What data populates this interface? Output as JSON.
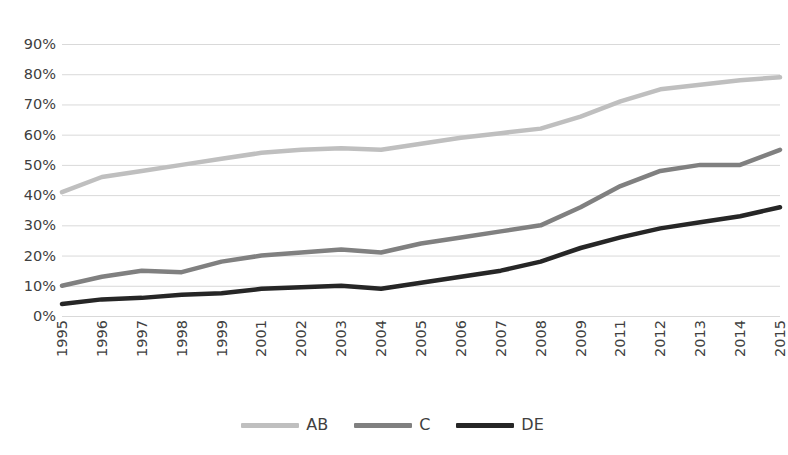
{
  "chart_data": {
    "type": "line",
    "title": "",
    "xlabel": "",
    "ylabel": "",
    "ylim": [
      0,
      90
    ],
    "grid": true,
    "legend_position": "bottom",
    "categories": [
      "1995",
      "1996",
      "1997",
      "1998",
      "1999",
      "2001",
      "2002",
      "2003",
      "2004",
      "2005",
      "2006",
      "2007",
      "2008",
      "2009",
      "2011",
      "2012",
      "2013",
      "2014",
      "2015"
    ],
    "y_tick_labels": [
      "90%",
      "80%",
      "70%",
      "60%",
      "50%",
      "40%",
      "30%",
      "20%",
      "10%",
      "0%"
    ],
    "y_tick_values": [
      90,
      80,
      70,
      60,
      50,
      40,
      30,
      20,
      10,
      0
    ],
    "series": [
      {
        "name": "AB",
        "color": "#BFBFBF",
        "values": [
          41,
          46,
          48,
          50,
          52,
          54,
          55,
          55.5,
          55,
          57,
          59,
          60.5,
          62,
          66,
          71,
          75,
          76.5,
          78,
          79
        ]
      },
      {
        "name": "C",
        "color": "#808080",
        "values": [
          10,
          13,
          15,
          14.5,
          18,
          20,
          21,
          22,
          21,
          24,
          26,
          28,
          30,
          36,
          43,
          48,
          50,
          50,
          55
        ]
      },
      {
        "name": "DE",
        "color": "#262626",
        "values": [
          4,
          5.5,
          6,
          7,
          7.5,
          9,
          9.5,
          10,
          9,
          11,
          13,
          15,
          18,
          22.5,
          26,
          29,
          31,
          33,
          36
        ]
      }
    ]
  },
  "legend": {
    "entries": [
      {
        "label": "AB"
      },
      {
        "label": "C"
      },
      {
        "label": "DE"
      }
    ]
  },
  "colors": {
    "gridline": "#D9D9D9",
    "text": "#404040",
    "background": "#FFFFFF",
    "series_ab": "#BFBFBF",
    "series_c": "#808080",
    "series_de": "#262626"
  }
}
